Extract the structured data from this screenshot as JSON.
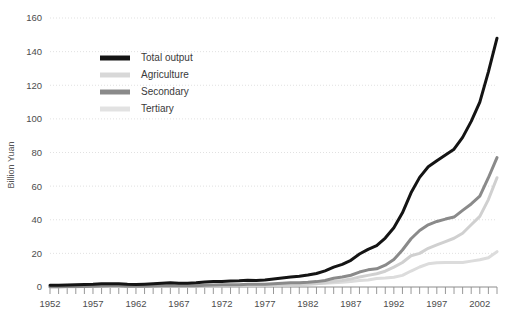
{
  "chart_data": {
    "type": "line",
    "title": "",
    "xlabel": "",
    "ylabel": "Billion Yuan",
    "ylim": [
      0,
      160
    ],
    "xlim": [
      1952,
      2004
    ],
    "yticks": [
      0,
      20,
      40,
      60,
      80,
      100,
      120,
      140,
      160
    ],
    "xticks": [
      1952,
      1957,
      1962,
      1967,
      1972,
      1977,
      1982,
      1987,
      1992,
      1997,
      2002
    ],
    "grid": true,
    "legend_position": "upper-left",
    "x": [
      1952,
      1953,
      1954,
      1955,
      1956,
      1957,
      1958,
      1959,
      1960,
      1961,
      1962,
      1963,
      1964,
      1965,
      1966,
      1967,
      1968,
      1969,
      1970,
      1971,
      1972,
      1973,
      1974,
      1975,
      1976,
      1977,
      1978,
      1979,
      1980,
      1981,
      1982,
      1983,
      1984,
      1985,
      1986,
      1987,
      1988,
      1989,
      1990,
      1991,
      1992,
      1993,
      1994,
      1995,
      1996,
      1997,
      1998,
      1999,
      2000,
      2001,
      2002,
      2003,
      2004
    ],
    "series": [
      {
        "name": "Total output",
        "color": "#141414",
        "width": 3.0,
        "values": [
          1.0,
          1.1,
          1.2,
          1.3,
          1.5,
          1.6,
          1.9,
          2.0,
          2.0,
          1.6,
          1.5,
          1.7,
          2.0,
          2.3,
          2.5,
          2.3,
          2.2,
          2.5,
          3.0,
          3.2,
          3.3,
          3.6,
          3.7,
          4.0,
          3.9,
          4.2,
          4.7,
          5.3,
          5.9,
          6.4,
          7.1,
          8.0,
          9.6,
          11.8,
          13.5,
          15.9,
          19.6,
          22.4,
          24.6,
          29.1,
          35.2,
          44.1,
          56.0,
          65.2,
          71.5,
          75.1,
          78.5,
          82.0,
          89.0,
          98.5,
          110.0,
          128.0,
          148.0
        ]
      },
      {
        "name": "Secondary",
        "color": "#8a8a8a",
        "width": 3.0,
        "values": [
          0.2,
          0.2,
          0.3,
          0.3,
          0.3,
          0.4,
          0.6,
          0.7,
          0.7,
          0.5,
          0.4,
          0.5,
          0.6,
          0.7,
          0.8,
          0.7,
          0.7,
          0.8,
          1.1,
          1.2,
          1.3,
          1.4,
          1.4,
          1.6,
          1.6,
          1.7,
          1.9,
          2.2,
          2.5,
          2.6,
          2.8,
          3.2,
          3.9,
          5.2,
          5.9,
          7.0,
          8.9,
          10.2,
          10.8,
          13.0,
          16.3,
          22.0,
          28.7,
          33.6,
          37.0,
          39.0,
          40.4,
          41.6,
          45.6,
          49.4,
          54.0,
          65.0,
          77.0
        ]
      },
      {
        "name": "Tertiary",
        "color": "#d0d0d0",
        "width": 3.0,
        "values": [
          0.2,
          0.2,
          0.2,
          0.2,
          0.3,
          0.3,
          0.3,
          0.4,
          0.4,
          0.3,
          0.3,
          0.4,
          0.4,
          0.5,
          0.5,
          0.5,
          0.5,
          0.5,
          0.6,
          0.6,
          0.7,
          0.7,
          0.8,
          0.8,
          0.8,
          0.9,
          0.9,
          1.1,
          1.3,
          1.5,
          1.7,
          2.0,
          2.5,
          3.3,
          3.9,
          4.7,
          5.9,
          6.9,
          7.9,
          9.4,
          11.8,
          14.6,
          18.6,
          20.0,
          23.0,
          25.0,
          27.0,
          29.0,
          32.0,
          37.0,
          42.0,
          52.0,
          65.0
        ]
      },
      {
        "name": "Agriculture",
        "color": "#dcdcdc",
        "width": 3.0,
        "values": [
          0.3,
          0.4,
          0.4,
          0.4,
          0.4,
          0.4,
          0.5,
          0.4,
          0.4,
          0.5,
          0.5,
          0.5,
          0.6,
          0.7,
          0.7,
          0.7,
          0.7,
          0.7,
          0.8,
          0.8,
          0.8,
          0.9,
          0.9,
          0.9,
          0.9,
          0.9,
          1.0,
          1.3,
          1.4,
          1.6,
          1.9,
          2.1,
          2.3,
          2.5,
          2.8,
          3.2,
          3.8,
          4.2,
          5.0,
          5.3,
          5.8,
          6.9,
          9.5,
          11.9,
          13.8,
          14.4,
          14.6,
          14.5,
          14.6,
          15.4,
          16.2,
          17.4,
          21.0
        ]
      }
    ],
    "legend": [
      {
        "label": "Total output",
        "color": "#141414"
      },
      {
        "label": "Agriculture",
        "color": "#d8d8d8"
      },
      {
        "label": "Secondary",
        "color": "#8a8a8a"
      },
      {
        "label": "Tertiary",
        "color": "#e2e2e2"
      }
    ]
  }
}
